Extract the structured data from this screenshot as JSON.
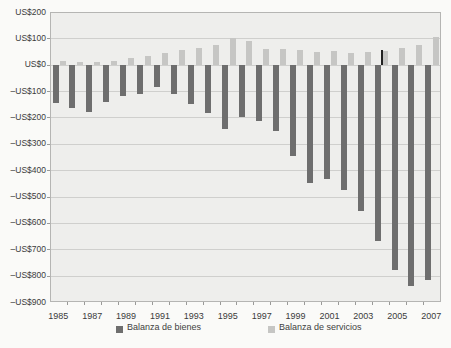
{
  "chart_data": {
    "type": "bar",
    "title": "",
    "xlabel": "",
    "ylabel": "",
    "categories": [
      "1985",
      "1986",
      "1987",
      "1988",
      "1989",
      "1990",
      "1991",
      "1992",
      "1993",
      "1994",
      "1995",
      "1996",
      "1997",
      "1998",
      "1999",
      "2000",
      "2001",
      "2002",
      "2003",
      "2004",
      "2005",
      "2006",
      "2007"
    ],
    "series": [
      {
        "name": "Balanza de bienes",
        "color": "#6e6e6e",
        "values": [
          -145,
          -165,
          -180,
          -140,
          -120,
          -110,
          -85,
          -110,
          -150,
          -185,
          -245,
          -200,
          -215,
          -250,
          -345,
          -450,
          -435,
          -475,
          -555,
          -670,
          -780,
          -840,
          -815
        ]
      },
      {
        "name": "Balanza de servicios",
        "color": "#c6c6c4",
        "values": [
          15,
          10,
          10,
          13,
          25,
          35,
          45,
          55,
          65,
          75,
          100,
          90,
          60,
          58,
          57,
          47,
          51,
          46,
          49,
          53,
          64,
          74,
          105
        ]
      }
    ],
    "ylim": [
      -900,
      200
    ],
    "y_ticks": [
      {
        "label": "US$200",
        "value": 200
      },
      {
        "label": "US$100",
        "value": 100
      },
      {
        "label": "US$0",
        "value": 0
      },
      {
        "label": "–US$100",
        "value": -100
      },
      {
        "label": "–US$200",
        "value": -200
      },
      {
        "label": "–US$300",
        "value": -300
      },
      {
        "label": "–US$400",
        "value": -400
      },
      {
        "label": "–US$500",
        "value": -500
      },
      {
        "label": "–US$600",
        "value": -600
      },
      {
        "label": "–US$700",
        "value": -700
      },
      {
        "label": "–US$800",
        "value": -800
      },
      {
        "label": "–US$900",
        "value": -900
      }
    ],
    "x_tick_labels": [
      "1985",
      "1987",
      "1989",
      "1991",
      "1993",
      "1995",
      "1997",
      "1999",
      "2001",
      "2003",
      "2005",
      "2007"
    ],
    "grid": true,
    "legend_position": "bottom"
  },
  "legend": {
    "items": [
      {
        "label": "Balanza de bienes",
        "color": "#6e6e6e"
      },
      {
        "label": "Balanza de servicios",
        "color": "#c6c6c4"
      }
    ]
  },
  "artifact_line": {
    "year": "2004",
    "value": 55,
    "color": "#222222"
  },
  "colors": {
    "page_bg": "#fafaf8",
    "plot_bg": "#eeeeec",
    "grid": "#cfcfcd",
    "border": "#b5b5b3",
    "text": "#3b3b3b"
  }
}
